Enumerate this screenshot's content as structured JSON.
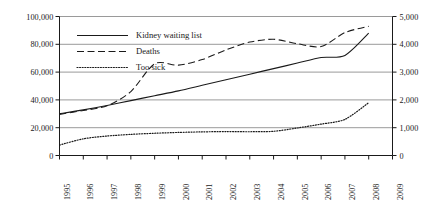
{
  "chart_data": {
    "type": "line",
    "title": "",
    "xlabel": "",
    "ylabel": "",
    "grid": true,
    "legend_position": "upper-left-inside",
    "x": [
      1995,
      1996,
      1997,
      1998,
      1999,
      2000,
      2001,
      2002,
      2003,
      2004,
      2005,
      2006,
      2007,
      2008
    ],
    "x_tick_labels": [
      "1995",
      "1996",
      "1997",
      "1998",
      "1999",
      "2000",
      "2001",
      "2002",
      "2003",
      "2004",
      "2005",
      "2006",
      "2007",
      "2008",
      "2009"
    ],
    "xlim": [
      1995,
      2009
    ],
    "axes": [
      {
        "id": "left",
        "ylim": [
          0,
          100000
        ],
        "ticks": [
          0,
          20000,
          40000,
          60000,
          80000,
          100000
        ],
        "tick_labels": [
          "0",
          "20,000",
          "40,000",
          "60,000",
          "80,000",
          "100,000"
        ]
      },
      {
        "id": "right",
        "ylim": [
          0,
          5000
        ],
        "ticks": [
          0,
          1000,
          2000,
          3000,
          4000,
          5000
        ],
        "tick_labels": [
          "0",
          "1,000",
          "2,000",
          "3,000",
          "4,000",
          "5,000"
        ]
      }
    ],
    "series": [
      {
        "name": "Kidney waiting list",
        "axis": "left",
        "style": "solid",
        "color": "#1a1a1a",
        "values": [
          30000,
          32800,
          36000,
          39500,
          43000,
          46500,
          50500,
          54500,
          58500,
          62500,
          66500,
          70500,
          72000,
          88000
        ]
      },
      {
        "name": "Deaths",
        "axis": "right",
        "style": "dashed",
        "color": "#1a1a1a",
        "values": [
          1480,
          1620,
          1790,
          2300,
          3300,
          3250,
          3450,
          3800,
          4080,
          4180,
          4020,
          3920,
          4420,
          4650
        ]
      },
      {
        "name": "Too sick",
        "axis": "right",
        "style": "dotted",
        "color": "#1a1a1a",
        "values": [
          375,
          600,
          700,
          760,
          800,
          830,
          850,
          860,
          855,
          870,
          990,
          1130,
          1300,
          1900
        ]
      }
    ]
  },
  "legend": {
    "items": [
      {
        "label": "Kidney waiting list",
        "style": "solid"
      },
      {
        "label": "Deaths",
        "style": "dashed"
      },
      {
        "label": "Too sick",
        "style": "dotted"
      }
    ]
  },
  "colors": {
    "line": "#1a1a1a",
    "grid": "#808080",
    "axis": "#1a1a1a",
    "background": "#ffffff"
  }
}
